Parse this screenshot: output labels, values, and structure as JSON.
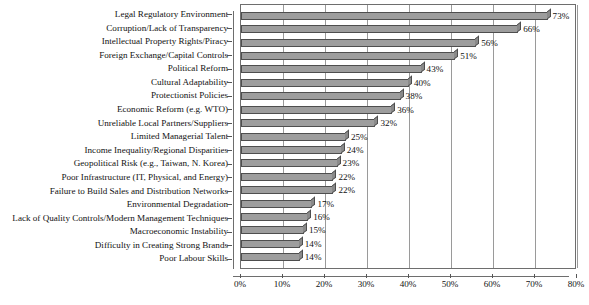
{
  "chart_data": {
    "type": "bar",
    "orientation": "horizontal",
    "title": "",
    "subtitle": "",
    "xlabel": "",
    "ylabel": "",
    "xlim": [
      0,
      80
    ],
    "xtick_labels": [
      "0%",
      "10%",
      "20%",
      "30%",
      "40%",
      "50%",
      "60%",
      "70%",
      "80%"
    ],
    "xticks": [
      0,
      10,
      20,
      30,
      40,
      50,
      60,
      70,
      80
    ],
    "grid": true,
    "legend": false,
    "value_suffix": "%",
    "categories": [
      "Legal Regulatory Environment",
      "Corruption/Lack of Transparency",
      "Intellectual Property Rights/Piracy",
      "Foreign Exchange/Capital Controls",
      "Political Reform",
      "Cultural Adaptability",
      "Protectionist Policies",
      "Economic Reform (e.g. WTO)",
      "Unreliable Local Partners/Suppliers",
      "Limited Managerial Talent",
      "Income Inequality/Regional Disparities",
      "Geopolitical Risk (e.g., Taiwan, N. Korea)",
      "Poor Infrastructure (IT, Physical, and Energy)",
      "Failure to Build Sales and Distribution Networks",
      "Environmental Degradation",
      "Lack of Quality Controls/Modern Management Techniques",
      "Macroeconomic Instability",
      "Difficulty in Creating Strong Brands",
      "Poor Labour Skills"
    ],
    "values": [
      73,
      66,
      56,
      51,
      43,
      40,
      38,
      36,
      32,
      25,
      24,
      23,
      22,
      22,
      17,
      16,
      15,
      14,
      14
    ],
    "value_labels": [
      "73%",
      "66%",
      "56%",
      "51%",
      "43%",
      "40%",
      "38%",
      "36%",
      "32%",
      "25%",
      "24%",
      "23%",
      "22%",
      "22%",
      "17%",
      "16%",
      "15%",
      "14%",
      "14%"
    ],
    "colors": {
      "bar_fill": "#9d9d9d",
      "bar_edge": "#4e4e4e",
      "gridline": "#9a9a9a",
      "axis": "#6e6e6e",
      "text": "#111111",
      "background": "#ffffff"
    }
  }
}
